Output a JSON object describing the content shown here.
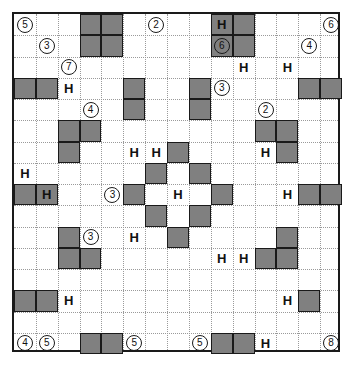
{
  "puzzle": {
    "title": "Nurikabe-style shaded grid puzzle",
    "grid": {
      "columns": 15,
      "rows": 16,
      "cell_width": 21.87,
      "cell_height": 21.25,
      "origin_x": 12,
      "origin_y": 12,
      "border_color": "#1a1a1a",
      "gridline_color": "#9a9a9a",
      "shaded_fill": "#808080",
      "background": "#ffffff"
    },
    "shaded_cells": [
      {
        "c": 3,
        "r": 0
      },
      {
        "c": 4,
        "r": 0
      },
      {
        "c": 3,
        "r": 1
      },
      {
        "c": 4,
        "r": 1
      },
      {
        "c": 9,
        "r": 0
      },
      {
        "c": 10,
        "r": 0
      },
      {
        "c": 9,
        "r": 1
      },
      {
        "c": 10,
        "r": 1
      },
      {
        "c": 0,
        "r": 3
      },
      {
        "c": 1,
        "r": 3
      },
      {
        "c": 5,
        "r": 3
      },
      {
        "c": 5,
        "r": 4
      },
      {
        "c": 8,
        "r": 3
      },
      {
        "c": 8,
        "r": 4
      },
      {
        "c": 13,
        "r": 3
      },
      {
        "c": 14,
        "r": 3
      },
      {
        "c": 2,
        "r": 5
      },
      {
        "c": 3,
        "r": 5
      },
      {
        "c": 2,
        "r": 6
      },
      {
        "c": 11,
        "r": 5
      },
      {
        "c": 12,
        "r": 5
      },
      {
        "c": 12,
        "r": 6
      },
      {
        "c": 7,
        "r": 6
      },
      {
        "c": 6,
        "r": 7
      },
      {
        "c": 8,
        "r": 7
      },
      {
        "c": 5,
        "r": 8
      },
      {
        "c": 9,
        "r": 8
      },
      {
        "c": 6,
        "r": 9
      },
      {
        "c": 8,
        "r": 9
      },
      {
        "c": 7,
        "r": 10
      },
      {
        "c": 0,
        "r": 8
      },
      {
        "c": 1,
        "r": 8
      },
      {
        "c": 13,
        "r": 8
      },
      {
        "c": 14,
        "r": 8
      },
      {
        "c": 2,
        "r": 10
      },
      {
        "c": 2,
        "r": 11
      },
      {
        "c": 3,
        "r": 11
      },
      {
        "c": 12,
        "r": 10
      },
      {
        "c": 11,
        "r": 11
      },
      {
        "c": 12,
        "r": 11
      },
      {
        "c": 0,
        "r": 13
      },
      {
        "c": 1,
        "r": 13
      },
      {
        "c": 13,
        "r": 13
      },
      {
        "c": 3,
        "r": 15
      },
      {
        "c": 4,
        "r": 15
      },
      {
        "c": 9,
        "r": 15
      },
      {
        "c": 10,
        "r": 15
      }
    ],
    "h_marks": [
      {
        "c": 2,
        "r": 3,
        "label": "H"
      },
      {
        "c": 9,
        "r": 0,
        "label": "H"
      },
      {
        "c": 10,
        "r": 2,
        "label": "H"
      },
      {
        "c": 12,
        "r": 2,
        "label": "H"
      },
      {
        "c": 0,
        "r": 7,
        "label": "H"
      },
      {
        "c": 1,
        "r": 8,
        "label": "H"
      },
      {
        "c": 5,
        "r": 6,
        "label": "H"
      },
      {
        "c": 6,
        "r": 6,
        "label": "H"
      },
      {
        "c": 11,
        "r": 6,
        "label": "H"
      },
      {
        "c": 7,
        "r": 8,
        "label": "H"
      },
      {
        "c": 12,
        "r": 8,
        "label": "H"
      },
      {
        "c": 5,
        "r": 10,
        "label": "H"
      },
      {
        "c": 9,
        "r": 11,
        "label": "H"
      },
      {
        "c": 10,
        "r": 11,
        "label": "H"
      },
      {
        "c": 12,
        "r": 13,
        "label": "H"
      },
      {
        "c": 2,
        "r": 13,
        "label": "H"
      },
      {
        "c": 11,
        "r": 15,
        "label": "H"
      }
    ],
    "clue_numbers": [
      {
        "c": 0,
        "r": 0,
        "value": "5"
      },
      {
        "c": 1,
        "r": 1,
        "value": "3"
      },
      {
        "c": 2,
        "r": 2,
        "value": "7"
      },
      {
        "c": 6,
        "r": 0,
        "value": "2"
      },
      {
        "c": 9,
        "r": 1,
        "value": "6"
      },
      {
        "c": 14,
        "r": 0,
        "value": "6"
      },
      {
        "c": 13,
        "r": 1,
        "value": "4"
      },
      {
        "c": 3,
        "r": 4,
        "value": "4"
      },
      {
        "c": 9,
        "r": 3,
        "value": "3"
      },
      {
        "c": 11,
        "r": 4,
        "value": "2"
      },
      {
        "c": 4,
        "r": 8,
        "value": "3"
      },
      {
        "c": 3,
        "r": 10,
        "value": "3"
      },
      {
        "c": 5,
        "r": 15,
        "value": "5"
      },
      {
        "c": 8,
        "r": 15,
        "value": "5"
      },
      {
        "c": 0,
        "r": 15,
        "value": "4"
      },
      {
        "c": 1,
        "r": 15,
        "value": "5"
      },
      {
        "c": 14,
        "r": 15,
        "value": "8"
      }
    ]
  }
}
